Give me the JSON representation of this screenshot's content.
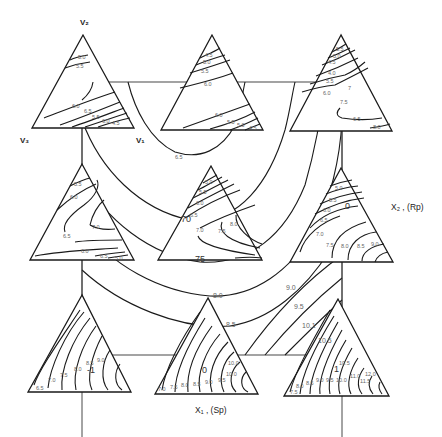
{
  "figure": {
    "type": "mixture-process contour diagram",
    "axes": {
      "x_label": "X₁ , (Sp)",
      "y_label": "X₂ , (Rp)"
    },
    "vertex_labels": {
      "top": "V₂",
      "left": "V₃",
      "right": "V₁"
    },
    "main_contours": [
      "6.5",
      "7.0",
      "7.5",
      "8.0",
      "8.5",
      "9.0",
      "9.5",
      "10.1",
      "10.5"
    ],
    "triangles": [
      {
        "position": "top-left",
        "labels": [
          "5.0",
          "5.5",
          "6.0",
          "6.5",
          "5.5",
          "6.0",
          "4.5"
        ]
      },
      {
        "position": "top-center",
        "labels": [
          "4.5",
          "5.0",
          "5.5",
          "6.0",
          "6.0",
          "5.5",
          "5.0",
          "4.5"
        ]
      },
      {
        "position": "top-right",
        "labels": [
          "5.5",
          "5.0",
          "4.5",
          "4.0",
          "5.5",
          "6.0",
          "7",
          "7.5",
          "6.5",
          "8.0"
        ]
      },
      {
        "position": "middle-left",
        "labels": [
          "5.5",
          "6.0",
          "7.0",
          "6.5",
          "6.0",
          "6.5",
          "5.0"
        ]
      },
      {
        "position": "middle-center",
        "labels": [
          "5.0",
          "5.5",
          "6.0",
          "6.5",
          "7.0",
          "7.0",
          "7.5",
          "8.0",
          "75"
        ]
      },
      {
        "position": "middle-right",
        "labels": [
          "5.0",
          "5.5",
          "6.0",
          "6.5",
          "7.0",
          "7.5",
          "8.0",
          "8.5",
          "9.0",
          "0"
        ]
      },
      {
        "position": "bottom-left",
        "labels": [
          "6.5",
          "7.0",
          "7.5",
          "8.0",
          "8.5",
          "9.0",
          "-1"
        ]
      },
      {
        "position": "bottom-center",
        "labels": [
          "7.0",
          "7.5",
          "8.0",
          "8.5",
          "9.0",
          "9.5",
          "10.0",
          "10.0",
          "0"
        ]
      },
      {
        "position": "bottom-right",
        "labels": [
          "7.5",
          "8.0",
          "8.5",
          "9.0",
          "9.5",
          "10.0",
          "10.5",
          "11.0",
          "11.5",
          "12.0",
          "1"
        ]
      }
    ],
    "main_labels": [
      {
        "text": "6.5",
        "x": 175,
        "y": 158
      },
      {
        "text": "70",
        "x": 180,
        "y": 221
      },
      {
        "text": "75",
        "x": 195,
        "y": 262
      },
      {
        "text": "8.0",
        "x": 212,
        "y": 296
      },
      {
        "text": "8.5",
        "x": 226,
        "y": 326
      },
      {
        "text": "9.0",
        "x": 286,
        "y": 290
      },
      {
        "text": "9.5",
        "x": 294,
        "y": 309
      },
      {
        "text": "10.1",
        "x": 302,
        "y": 328
      },
      {
        "text": "10.5",
        "x": 318,
        "y": 343
      }
    ]
  }
}
